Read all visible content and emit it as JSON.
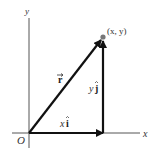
{
  "diagram": {
    "type": "vector-decomposition",
    "axes": {
      "x_label": "x",
      "y_label": "y",
      "origin_label": "O"
    },
    "point_label": "(x, y)",
    "vectors": [
      {
        "name": "position-vector",
        "label": "r",
        "label_decoration": "arrow"
      },
      {
        "name": "x-component",
        "label_coef": "x",
        "label_unit": "i",
        "label_decoration": "hat"
      },
      {
        "name": "y-component",
        "label_coef": "y",
        "label_unit": "j",
        "label_decoration": "hat"
      }
    ],
    "colors": {
      "axis": "#555555",
      "vector": "#111111",
      "point": "#777777",
      "background": "#ffffff"
    }
  }
}
